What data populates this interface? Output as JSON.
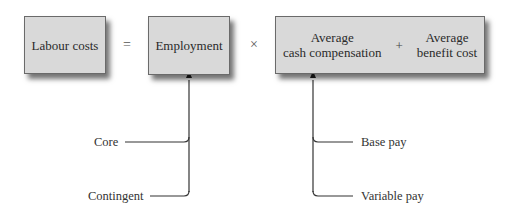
{
  "equation": {
    "lhs": "Labour costs",
    "equals": "=",
    "factor1": "Employment",
    "times": "×",
    "factor2": {
      "term1_line1": "Average",
      "term1_line2": "cash compensation",
      "plus": "+",
      "term2_line1": "Average",
      "term2_line2": "benefit cost"
    }
  },
  "employment_inputs": [
    "Core",
    "Contingent"
  ],
  "compensation_inputs": [
    "Base pay",
    "Variable pay"
  ],
  "colors": {
    "box_fill": "#d9d9d9",
    "box_border": "#6a6a6a",
    "line": "#333333",
    "text": "#2a2a2a"
  }
}
